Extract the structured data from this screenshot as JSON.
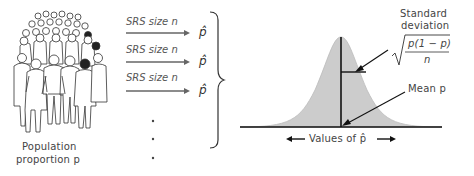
{
  "population": {
    "label_line1": "Population",
    "label_line2": "proportion p",
    "icon": "crowd-of-people-icon"
  },
  "samples": [
    {
      "label": "SRS size n",
      "result": "p̂"
    },
    {
      "label": "SRS size n",
      "result": "p̂"
    },
    {
      "label": "SRS size n",
      "result": "p̂"
    }
  ],
  "ellipsis": "⋮",
  "distribution": {
    "shape": "normal-curve",
    "fill_color": "#cccccc",
    "line_color": "#111111",
    "sd_label_line1": "Standard",
    "sd_label_line2": "deviation",
    "sd_formula_numerator": "p(1 − p)",
    "sd_formula_denominator": "n",
    "mean_label": "Mean p",
    "axis_label": "Values of p̂",
    "axis_left_arrow": "←",
    "axis_right_arrow": "→"
  }
}
